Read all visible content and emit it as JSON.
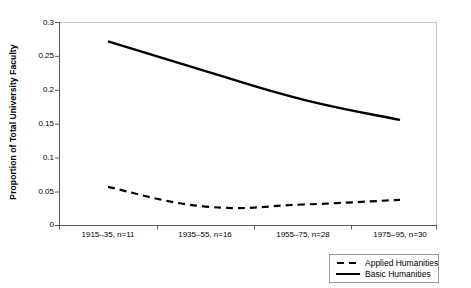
{
  "chart_data": {
    "type": "line",
    "title": "",
    "xlabel": "",
    "ylabel": "Proportion of Total University Faculty",
    "categories": [
      "1915–35, n=11",
      "1935–55, n=16",
      "1955–75, n=28",
      "1975–95, n=30"
    ],
    "ylim": [
      0,
      0.3
    ],
    "yticks": [
      0,
      0.05,
      0.1,
      0.15,
      0.2,
      0.25,
      0.3
    ],
    "ytick_labels": [
      "0",
      "0.05",
      "0.1",
      "0.15",
      "0.2",
      "0.25",
      "0.3"
    ],
    "grid": false,
    "legend_position": "bottom-right",
    "series": [
      {
        "name": "Applied Humanities",
        "style": "dashed",
        "color": "#000000",
        "values": [
          0.057,
          0.028,
          0.031,
          0.038
        ]
      },
      {
        "name": "Basic Humanities",
        "style": "solid",
        "color": "#000000",
        "values": [
          0.272,
          0.228,
          0.186,
          0.156
        ]
      }
    ]
  },
  "axis": {
    "y_title": "Proportion of Total University Faculty"
  },
  "legend": {
    "items": [
      {
        "label": "Applied Humanities",
        "key": "dashed-line-key"
      },
      {
        "label": "Basic Humanities",
        "key": "solid-line-key"
      }
    ]
  },
  "ticks": {
    "y": [
      "0.3",
      "0.25",
      "0.2",
      "0.15",
      "0.1",
      "0.05",
      "0"
    ],
    "x": [
      "1915–35, n=11",
      "1935–55, n=16",
      "1955–75, n=28",
      "1975–95, n=30"
    ]
  }
}
